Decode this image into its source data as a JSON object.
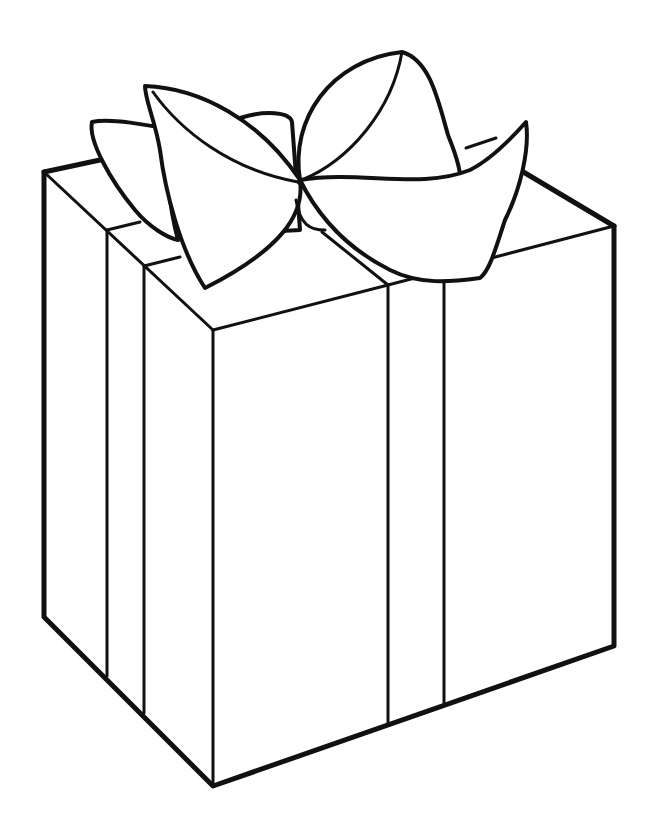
{
  "image": {
    "subject": "Gift box with bow (line-art coloring page)",
    "background_color": "#ffffff",
    "line_color": "#111111",
    "width": 652,
    "height": 838
  },
  "parts": {
    "box": "gift-box",
    "bow": "bow",
    "ribbon": "ribbon"
  }
}
